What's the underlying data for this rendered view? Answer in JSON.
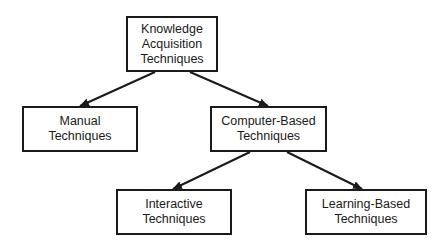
{
  "diagram": {
    "type": "tree",
    "colors": {
      "stroke": "#1a1a1a",
      "background": "#ffffff",
      "text": "#1a1a1a"
    },
    "nodes": {
      "root": {
        "lines": [
          "Knowledge",
          "Acquisition",
          "Techniques"
        ]
      },
      "manual": {
        "lines": [
          "Manual",
          "Techniques"
        ]
      },
      "computer": {
        "lines": [
          "Computer-Based",
          "Techniques"
        ]
      },
      "interactive": {
        "lines": [
          "Interactive",
          "Techniques"
        ]
      },
      "learning": {
        "lines": [
          "Learning-Based",
          "Techniques"
        ]
      }
    },
    "edges": [
      {
        "from": "Knowledge Acquisition Techniques",
        "to": "Manual Techniques"
      },
      {
        "from": "Knowledge Acquisition Techniques",
        "to": "Computer-Based Techniques"
      },
      {
        "from": "Computer-Based Techniques",
        "to": "Interactive Techniques"
      },
      {
        "from": "Computer-Based Techniques",
        "to": "Learning-Based Techniques"
      }
    ]
  }
}
